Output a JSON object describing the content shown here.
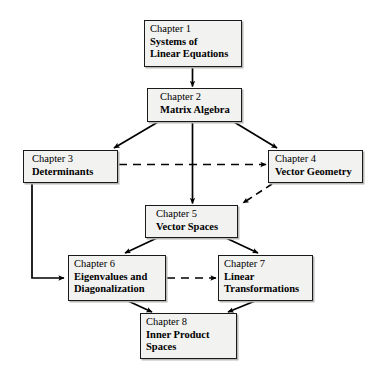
{
  "diagram": {
    "type": "flow-diagram",
    "background_color": "#ffffff",
    "node_fill_color": "#f2f2f0",
    "node_border_color": "#1a1a1a",
    "edge_color": "#000000"
  },
  "nodes": [
    {
      "id": "chapter-1",
      "chapter": "Chapter 1",
      "title_lines": [
        "Systems of",
        "Linear Equations"
      ],
      "line1": "Systems of",
      "line2": "Linear Equations",
      "line3": "",
      "x": 144,
      "y": 20,
      "w": 98,
      "h": 47
    },
    {
      "id": "chapter-2",
      "chapter": "Chapter 2",
      "title_lines": [
        "Matrix Algebra"
      ],
      "line1": "Matrix Algebra",
      "line2": "",
      "line3": "",
      "x": 147,
      "y": 88,
      "w": 95,
      "h": 34
    },
    {
      "id": "chapter-3",
      "chapter": "Chapter 3",
      "title_lines": [
        "Determinants"
      ],
      "line1": "Determinants",
      "line2": "",
      "line3": "",
      "x": 23,
      "y": 150,
      "w": 95,
      "h": 33
    },
    {
      "id": "chapter-4",
      "chapter": "Chapter 4",
      "title_lines": [
        "Vector Geometry"
      ],
      "line1": "Vector Geometry",
      "line2": "",
      "line3": "",
      "x": 268,
      "y": 150,
      "w": 95,
      "h": 33
    },
    {
      "id": "chapter-5",
      "chapter": "Chapter 5",
      "title_lines": [
        "Vector Spaces"
      ],
      "line1": "Vector Spaces",
      "line2": "",
      "line3": "",
      "x": 145,
      "y": 205,
      "w": 93,
      "h": 33
    },
    {
      "id": "chapter-6",
      "chapter": "Chapter 6",
      "title_lines": [
        "Eigenvalues and",
        "Diagonalization"
      ],
      "line1": "Eigenvalues and",
      "line2": "Diagonalization",
      "line3": "",
      "x": 68,
      "y": 255,
      "w": 98,
      "h": 46
    },
    {
      "id": "chapter-7",
      "chapter": "Chapter 7",
      "title_lines": [
        "Linear",
        "Transformations"
      ],
      "line1": "Linear",
      "line2": "Transformations",
      "line3": "",
      "x": 218,
      "y": 255,
      "w": 95,
      "h": 46
    },
    {
      "id": "chapter-8",
      "chapter": "Chapter 8",
      "title_lines": [
        "Inner Product",
        "Spaces"
      ],
      "line1": "Inner Product",
      "line2": "Spaces",
      "line3": "",
      "x": 140,
      "y": 313,
      "w": 97,
      "h": 46
    }
  ],
  "edges": [
    {
      "id": "e1",
      "from": "chapter-1",
      "to": "chapter-2",
      "style": "solid",
      "shape": "vertical"
    },
    {
      "id": "e2",
      "from": "chapter-2",
      "to": "chapter-3",
      "style": "solid",
      "shape": "diagonal"
    },
    {
      "id": "e3",
      "from": "chapter-2",
      "to": "chapter-4",
      "style": "solid",
      "shape": "diagonal"
    },
    {
      "id": "e4",
      "from": "chapter-2",
      "to": "chapter-5",
      "style": "solid",
      "shape": "vertical"
    },
    {
      "id": "e5",
      "from": "chapter-3",
      "to": "chapter-4",
      "style": "dashed",
      "shape": "horizontal"
    },
    {
      "id": "e6",
      "from": "chapter-3",
      "to": "chapter-6",
      "style": "solid",
      "shape": "elbow"
    },
    {
      "id": "e7",
      "from": "chapter-4",
      "to": "chapter-5",
      "style": "dashed",
      "shape": "diagonal"
    },
    {
      "id": "e8",
      "from": "chapter-5",
      "to": "chapter-6",
      "style": "solid",
      "shape": "diagonal"
    },
    {
      "id": "e9",
      "from": "chapter-5",
      "to": "chapter-7",
      "style": "solid",
      "shape": "diagonal"
    },
    {
      "id": "e10",
      "from": "chapter-6",
      "to": "chapter-7",
      "style": "dashed",
      "shape": "horizontal"
    },
    {
      "id": "e11",
      "from": "chapter-6",
      "to": "chapter-8",
      "style": "solid",
      "shape": "diagonal"
    },
    {
      "id": "e12",
      "from": "chapter-7",
      "to": "chapter-8",
      "style": "solid",
      "shape": "diagonal"
    }
  ]
}
